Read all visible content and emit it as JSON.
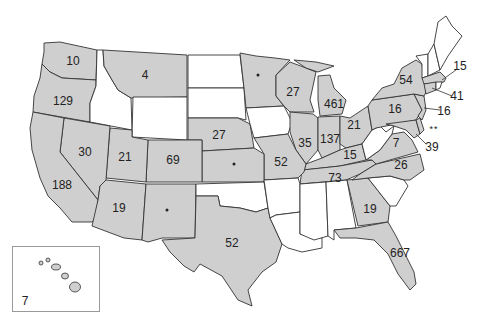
{
  "map": {
    "type": "choropleth-count",
    "region": "United States",
    "colors": {
      "shaded": "#cfcfcf",
      "unshaded": "#ffffff",
      "border": "#333333",
      "text": "#222222"
    },
    "legend_symbols": {
      "dot": "*",
      "double_dot": "**"
    },
    "states": {
      "WA": "10",
      "OR": "129",
      "CA": "188",
      "NV": "30",
      "MT": "4",
      "UT": "21",
      "AZ": "19",
      "CO": "69",
      "NM": "•",
      "NE": "27",
      "KS": "•",
      "TX": "52",
      "MN": "•",
      "WI": "27",
      "MO": "52",
      "IL": "35",
      "MI": "461",
      "IN": "137",
      "OH": "21",
      "KY": "15",
      "TN": "73",
      "PA": "16",
      "NY": "54",
      "VA": "7",
      "NC": "26",
      "GA": "19",
      "FL": "667",
      "MA": "15",
      "CT": "41",
      "NJ": "16",
      "DE": "**",
      "MD": "39",
      "HI": "7"
    },
    "unshaded_states": [
      "ID",
      "WY",
      "ND",
      "SD",
      "IA",
      "OK",
      "AR",
      "LA",
      "MS",
      "AL",
      "SC",
      "WV",
      "ME",
      "NH",
      "VT",
      "RI"
    ]
  }
}
